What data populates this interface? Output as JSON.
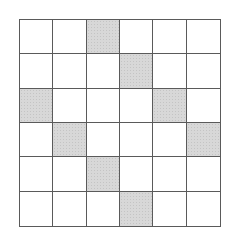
{
  "grid": {
    "rows": 6,
    "cols": 6,
    "shaded_cells": [
      [
        0,
        2
      ],
      [
        1,
        3
      ],
      [
        2,
        0
      ],
      [
        2,
        4
      ],
      [
        3,
        1
      ],
      [
        3,
        5
      ],
      [
        4,
        2
      ],
      [
        5,
        3
      ]
    ],
    "colors": {
      "line": "#5a5a5a",
      "shade": "#d8d8d8",
      "empty": "#ffffff"
    }
  }
}
